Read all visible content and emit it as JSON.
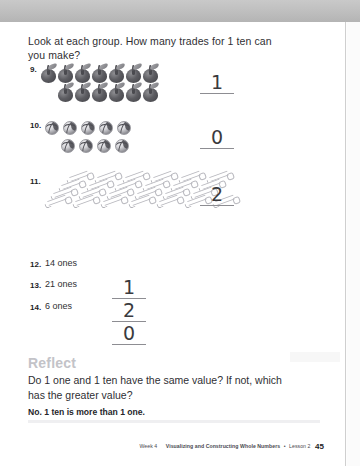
{
  "page": {
    "question_prompt": "Look at each group. How many trades for 1 ten can you make?"
  },
  "items": [
    {
      "number": "9.",
      "group_type": "apples",
      "rows": [
        7,
        6
      ],
      "total": 13,
      "answer": "1"
    },
    {
      "number": "10.",
      "group_type": "balls",
      "rows": [
        5,
        4
      ],
      "total": 9,
      "answer": "0"
    },
    {
      "number": "11.",
      "group_type": "pencils",
      "rows": [
        6,
        6,
        6,
        7
      ],
      "total": 25,
      "answer": "2"
    }
  ],
  "word_items": [
    {
      "number": "12.",
      "label": "14 ones",
      "answer": "1"
    },
    {
      "number": "13.",
      "label": "21 ones",
      "answer": "2"
    },
    {
      "number": "14.",
      "label": "6 ones",
      "answer": "0"
    }
  ],
  "reflect": {
    "heading": "Reflect",
    "question": "Do 1 one and 1 ten have the same value? If not, which has the greater value?",
    "answer": "No. 1 ten is more than 1 one."
  },
  "footer": {
    "week": "Week 4",
    "unit": "Visualizing and Constructing Whole Numbers",
    "separator": "•",
    "lesson": "Lesson 2",
    "page_number": "45"
  },
  "colors": {
    "text": "#2f2f33",
    "reflect_heading": "#c3c3c8",
    "rule": "#8d8d92",
    "band": "#bdbdbd"
  }
}
